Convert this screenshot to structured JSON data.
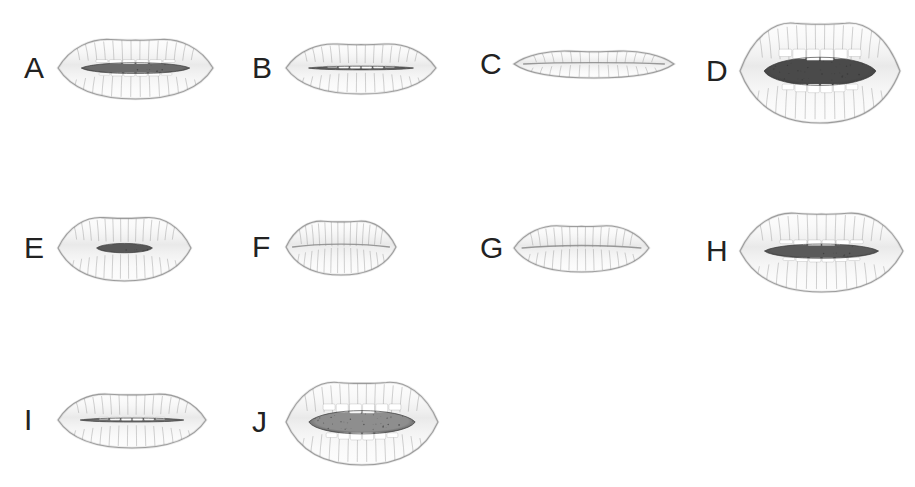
{
  "figure": {
    "background_color": "#ffffff",
    "label_color": "#222222",
    "ink_color": "#8a8a8a",
    "dark_interior_color": "#5e5e5e",
    "mid_interior_color": "#9a9a9a",
    "teeth_color": "#ffffff",
    "layout": {
      "columns": 4,
      "rows": 3,
      "panel_count": 10
    }
  },
  "panels": [
    {
      "label": "A",
      "name": "mouth-a",
      "description": "open mouth, upper and lower teeth visible, thin dark gap",
      "x": 24,
      "y": 18,
      "width": 210,
      "height": 100,
      "mouth_width": 155,
      "mouth_height": 62,
      "opening": "teeth-open",
      "interior_shade": "#6a6a6a",
      "upper_lip_thickness": 13,
      "lower_lip_thickness": 20
    },
    {
      "label": "B",
      "name": "mouth-b",
      "description": "slightly open mouth, narrow dark gap, teeth partly visible",
      "x": 252,
      "y": 20,
      "width": 210,
      "height": 95,
      "mouth_width": 150,
      "mouth_height": 52,
      "opening": "narrow-open",
      "interior_shade": "#5f5f5f",
      "upper_lip_thickness": 11,
      "lower_lip_thickness": 17
    },
    {
      "label": "C",
      "name": "mouth-c",
      "description": "closed wide thin lips, nearly flat line",
      "x": 480,
      "y": 24,
      "width": 210,
      "height": 80,
      "mouth_width": 160,
      "mouth_height": 28,
      "opening": "closed",
      "interior_shade": "#8a8a8a",
      "upper_lip_thickness": 7,
      "lower_lip_thickness": 9
    },
    {
      "label": "D",
      "name": "mouth-d",
      "description": "wide open mouth, large dark interior cavity, teeth edges at top and bottom",
      "x": 706,
      "y": 8,
      "width": 210,
      "height": 125,
      "mouth_width": 160,
      "mouth_height": 104,
      "opening": "wide-open",
      "interior_shade": "#4a4a4a",
      "upper_lip_thickness": 14,
      "lower_lip_thickness": 22
    },
    {
      "label": "E",
      "name": "mouth-e",
      "description": "pursed rounded lips, small dark oval opening",
      "x": 24,
      "y": 200,
      "width": 210,
      "height": 95,
      "mouth_width": 133,
      "mouth_height": 66,
      "opening": "pursed",
      "interior_shade": "#575757",
      "upper_lip_thickness": 14,
      "lower_lip_thickness": 24
    },
    {
      "label": "F",
      "name": "mouth-f",
      "description": "small closed mouth, compressed lips",
      "x": 252,
      "y": 202,
      "width": 210,
      "height": 90,
      "mouth_width": 110,
      "mouth_height": 56,
      "opening": "closed",
      "interior_shade": "#8a8a8a",
      "upper_lip_thickness": 12,
      "lower_lip_thickness": 20
    },
    {
      "label": "G",
      "name": "mouth-g",
      "description": "very light closed narrow mouth, faint outline",
      "x": 480,
      "y": 204,
      "width": 210,
      "height": 88,
      "mouth_width": 135,
      "mouth_height": 48,
      "opening": "closed",
      "interior_shade": "#9c9c9c",
      "upper_lip_thickness": 10,
      "lower_lip_thickness": 14
    },
    {
      "label": "H",
      "name": "mouth-h",
      "description": "wide open horizontally, dark band with upper and lower teeth",
      "x": 706,
      "y": 196,
      "width": 210,
      "height": 110,
      "mouth_width": 163,
      "mouth_height": 82,
      "opening": "teeth-open",
      "interior_shade": "#5a5a5a",
      "upper_lip_thickness": 13,
      "lower_lip_thickness": 22
    },
    {
      "label": "I",
      "name": "mouth-i",
      "description": "slightly open asymmetric mouth, thin dark line, full lower lip",
      "x": 24,
      "y": 372,
      "width": 210,
      "height": 95,
      "mouth_width": 148,
      "mouth_height": 56,
      "opening": "narrow-open",
      "interior_shade": "#6d6d6d",
      "upper_lip_thickness": 11,
      "lower_lip_thickness": 20
    },
    {
      "label": "J",
      "name": "mouth-j",
      "description": "open mouth with mid-gray interior, upper and lower teeth rows visible",
      "x": 252,
      "y": 368,
      "width": 210,
      "height": 108,
      "mouth_width": 152,
      "mouth_height": 86,
      "opening": "wide-open",
      "interior_shade": "#8e8e8e",
      "upper_lip_thickness": 13,
      "lower_lip_thickness": 22
    }
  ]
}
